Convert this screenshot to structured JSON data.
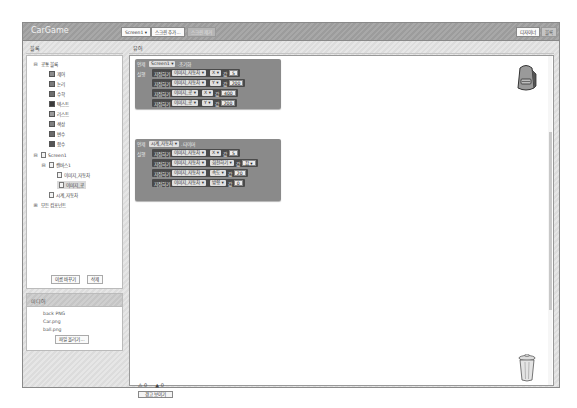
{
  "app": {
    "title": "CarGame",
    "screen_select": "Screen1 ▾",
    "add_screen": "스크린 추가...",
    "remove_screen": "스크린 제거",
    "designer_btn": "디자이너",
    "blocks_btn": "블록"
  },
  "left_panel": {
    "header": "블록",
    "builtin_label": "공통 블록",
    "builtin_items": [
      {
        "label": "제어",
        "color": "#8c8c8c"
      },
      {
        "label": "논리",
        "color": "#7a7a7a"
      },
      {
        "label": "수학",
        "color": "#6e6e6e"
      },
      {
        "label": "텍스트",
        "color": "#3a3a3a"
      },
      {
        "label": "리스트",
        "color": "#9a9a9a"
      },
      {
        "label": "색상",
        "color": "#808080"
      },
      {
        "label": "변수",
        "color": "#6a6a6a"
      },
      {
        "label": "함수",
        "color": "#555555"
      }
    ],
    "screen_label": "Screen1",
    "canvas_label": "캔버스1",
    "sprites": [
      "이미지_자동차",
      "이미지_공"
    ],
    "selected_sprite": "이미지_공",
    "clock_label": "시계_자동차",
    "any_component": "모든 컴포넌트",
    "rename_btn": "이름 바꾸기",
    "delete_btn": "삭제"
  },
  "media": {
    "header": "미디어",
    "files": [
      "back PNG",
      "Car.png",
      "ball.png"
    ],
    "upload_btn": "파일 올리기..."
  },
  "workspace": {
    "header": "뷰어",
    "event1": {
      "when": "언제",
      "component": "Screen1 ▾",
      "event": ".초기화",
      "do": "실행",
      "rows": [
        {
          "set": "지정하기",
          "target": "이미지_자동차 ▾",
          "prop": "X ▾",
          "to": "값",
          "value": "5"
        },
        {
          "set": "지정하기",
          "target": "이미지_자동차 ▾",
          "prop": "Y ▾",
          "to": "값",
          "value": "200"
        },
        {
          "set": "지정하기",
          "target": "이미지_공 ▾",
          "prop": "X ▾",
          "to": "값",
          "value": "400"
        },
        {
          "set": "지정하기",
          "target": "이미지_공 ▾",
          "prop": "Y ▾",
          "to": "값",
          "value": "200"
        }
      ]
    },
    "event2": {
      "when": "언제",
      "component": "시계_자동차 ▾",
      "event": ".타이머",
      "do": "실행",
      "rows": [
        {
          "set": "지정하기",
          "target": "이미지_자동차 ▾",
          "prop": "X ▾",
          "to": "값",
          "value": "5"
        },
        {
          "set": "지정하기",
          "target": "이미지_자동차 ▾",
          "prop": "회전하기 ▾",
          "to": "값",
          "value": "참 ▾"
        },
        {
          "set": "지정하기",
          "target": "이미지_자동차 ▾",
          "prop": "속도 ▾",
          "to": "값",
          "value": "20"
        },
        {
          "set": "지정하기",
          "target": "이미지_자동차 ▾",
          "prop": "방향 ▾",
          "to": "값",
          "value": "0"
        }
      ]
    },
    "warnings_count": "0",
    "errors_count": "0",
    "show_warnings_btn": "경고 보이기"
  }
}
